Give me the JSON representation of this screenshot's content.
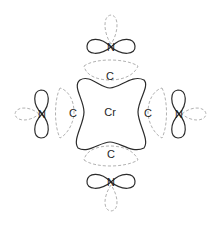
{
  "diagram": {
    "colors": {
      "solid": "#2b2b2b",
      "dashed": "#a8a8a8",
      "background": "#ffffff"
    },
    "center_atom": {
      "label": "Cr",
      "x": 110,
      "y": 112
    },
    "carbon_atoms": [
      {
        "id": "top",
        "label": "C",
        "x": 110,
        "y": 76
      },
      {
        "id": "left",
        "label": "C",
        "x": 73,
        "y": 113
      },
      {
        "id": "right",
        "label": "C",
        "x": 148,
        "y": 113
      },
      {
        "id": "bottom",
        "label": "C",
        "x": 111,
        "y": 154
      }
    ],
    "nitrogen_atoms": [
      {
        "id": "top",
        "label": "N",
        "x": 111,
        "y": 47
      },
      {
        "id": "left",
        "label": "N",
        "x": 42,
        "y": 114
      },
      {
        "id": "right",
        "label": "N",
        "x": 179,
        "y": 114
      },
      {
        "id": "bottom",
        "label": "N",
        "x": 111,
        "y": 182
      }
    ]
  }
}
